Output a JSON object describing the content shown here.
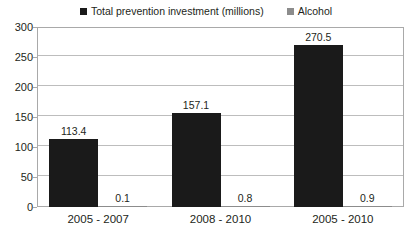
{
  "chart_data": {
    "type": "bar",
    "title": "",
    "subtitle": "",
    "xlabel": "",
    "ylabel": "",
    "categories": [
      "2005 - 2007",
      "2008 - 2010",
      "2005 - 2010"
    ],
    "series": [
      {
        "name": "Total prevention investment (millions)",
        "color": "#1a1a1a",
        "values": [
          113.4,
          157.1,
          270.5
        ],
        "labels": [
          "113.4",
          "157.1",
          "270.5"
        ]
      },
      {
        "name": "Alcohol",
        "color": "#8c8c8c",
        "values": [
          0.1,
          0.8,
          0.9
        ],
        "labels": [
          "0.1",
          "0.8",
          "0.9"
        ]
      }
    ],
    "ylim": [
      0,
      300
    ],
    "yticks": [
      0,
      50,
      100,
      150,
      200,
      250,
      300
    ],
    "ytick_labels": [
      "0",
      "50",
      "100",
      "150",
      "200",
      "250",
      "300"
    ],
    "grid": true,
    "legend_position": "top"
  },
  "legend": {
    "entries": [
      {
        "label": "Total prevention investment (millions)",
        "swatch_name": "legend-swatch-black",
        "color": "#1a1a1a"
      },
      {
        "label": "Alcohol",
        "swatch_name": "legend-swatch-grey",
        "color": "#8c8c8c"
      }
    ]
  },
  "colors": {
    "background": "#ffffff",
    "text": "#231f20",
    "gridline": "#bdbdbd",
    "frame": "#a9a9a9",
    "series_primary": "#1a1a1a",
    "series_secondary": "#8c8c8c"
  }
}
